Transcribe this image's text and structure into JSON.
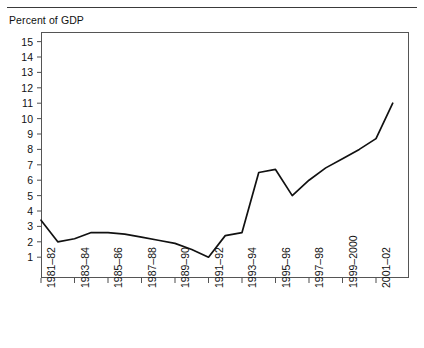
{
  "figure": {
    "y_axis_caption": "Percent of GDP",
    "top_rule": true
  },
  "chart_data": {
    "type": "line",
    "title": "",
    "subtitle": "",
    "xlabel": "",
    "ylabel": "Percent of GDP",
    "ylim": [
      0,
      15.6
    ],
    "xlim": [
      0,
      21
    ],
    "grid": false,
    "legend": null,
    "y_ticks": [
      1,
      2,
      3,
      4,
      5,
      6,
      7,
      8,
      9,
      10,
      11,
      12,
      13,
      14,
      15
    ],
    "y_tick_labels": [
      "1",
      "2",
      "3",
      "4",
      "5",
      "6",
      "7",
      "8",
      "9",
      "10",
      "11",
      "12",
      "13",
      "14",
      "15"
    ],
    "x_tick_labels": [
      "1981–82",
      "1983–84",
      "1985–86",
      "1987–88",
      "1989–90",
      "1991–92",
      "1993–94",
      "1995–96",
      "1997–98",
      "1999–2000",
      "2001–02"
    ],
    "x_tick_indices": [
      0,
      2,
      4,
      6,
      8,
      10,
      12,
      14,
      16,
      18,
      20
    ],
    "series": [
      {
        "name": "Percent of GDP",
        "color": "#111111",
        "x": [
          "1981–82",
          "1982–83",
          "1983–84",
          "1984–85",
          "1985–86",
          "1986–87",
          "1987–88",
          "1988–89",
          "1989–90",
          "1990–91",
          "1991–92",
          "1992–93",
          "1993–94",
          "1994–95",
          "1995–96",
          "1996–97",
          "1997–98",
          "1998–99",
          "1999–2000",
          "2000–01",
          "2001–02",
          "2002–03"
        ],
        "values": [
          3.4,
          2.0,
          2.2,
          2.6,
          2.6,
          2.5,
          2.3,
          2.1,
          1.9,
          1.5,
          1.0,
          2.4,
          2.6,
          6.5,
          6.7,
          5.0,
          6.0,
          6.8,
          7.4,
          8.0,
          8.7,
          11.0
        ]
      }
    ]
  }
}
